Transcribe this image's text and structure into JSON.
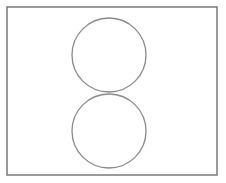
{
  "diagram": {
    "canvas": {
      "width": 226,
      "height": 183,
      "background": "#ffffff"
    },
    "frame": {
      "x": 7,
      "y": 7,
      "width": 210,
      "height": 168,
      "stroke": "#7a7a7a",
      "stroke_width": 1.5
    },
    "circles": [
      {
        "name": "top-circle",
        "cx": 109,
        "cy": 55,
        "r": 37,
        "stroke": "#8a8a8a",
        "stroke_width": 1.3
      },
      {
        "name": "bottom-circle",
        "cx": 109,
        "cy": 131,
        "r": 37,
        "stroke": "#8a8a8a",
        "stroke_width": 1.3
      }
    ]
  }
}
